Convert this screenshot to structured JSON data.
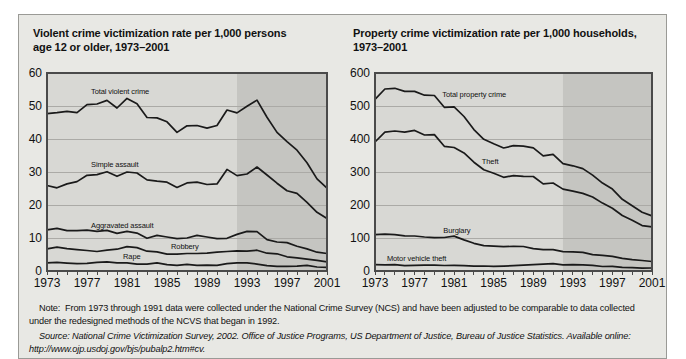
{
  "figure": {
    "note": "Note:  From 1973 through 1991 data were collected under the National Crime Survey (NCS) and have been adjusted to be comparable to data collected under the redesigned methods of the NCVS that began in 1992.",
    "source_italic": "Source: National Crime Victimization Survey, 2002.",
    "source_rest": " Office of Justice Programs, US Department of Justice, Bureau of Justice Statistics. Available online: http://www.ojp.usdoj.gov/bjs/pubalp2.htm#cv.",
    "colors": {
      "figure_bg": "#e8e8e4",
      "plot_bg": "#d8d8d4",
      "redesign_band_bg": "#c5c5c1",
      "grid": "#abaaa6",
      "axis": "#4a4a4a",
      "line": "#1a1a1a",
      "text": "#111111"
    }
  },
  "charts": [
    {
      "title_line1": "Violent crime victimization rate per 1,000 persons",
      "title_line2": "age 12 or older, 1973–2001"
    },
    {
      "title_line1": "Property crime victimization rate per 1,000 households,",
      "title_line2": "1973–2001"
    }
  ],
  "chart_data": [
    {
      "type": "line",
      "title": "Violent crime victimization rate per 1,000 persons age 12 or older, 1973–2001",
      "xlabel": "",
      "ylabel": "",
      "ylim": [
        0,
        60
      ],
      "yticks": [
        0,
        10,
        20,
        30,
        40,
        50,
        60
      ],
      "x": [
        1973,
        1974,
        1975,
        1976,
        1977,
        1978,
        1979,
        1980,
        1981,
        1982,
        1983,
        1984,
        1985,
        1986,
        1987,
        1988,
        1989,
        1990,
        1991,
        1992,
        1993,
        1994,
        1995,
        1996,
        1997,
        1998,
        1999,
        2000,
        2001
      ],
      "xtick_labels": [
        1973,
        1977,
        1981,
        1985,
        1989,
        1993,
        1997,
        2001
      ],
      "shaded_band": {
        "from": 1992,
        "to": 2001
      },
      "grid": true,
      "legend_position": "inline-labels",
      "series": [
        {
          "name": "Total violent crime",
          "values": [
            47.7,
            48.0,
            48.4,
            48.0,
            50.4,
            50.6,
            51.7,
            49.4,
            52.3,
            50.7,
            46.5,
            46.4,
            45.2,
            42.0,
            44.0,
            44.1,
            43.3,
            44.1,
            48.8,
            47.9,
            49.9,
            51.8,
            46.6,
            42.0,
            39.2,
            36.6,
            32.8,
            27.9,
            25.1
          ],
          "label": {
            "x": 1977.4,
            "y": 53.8
          }
        },
        {
          "name": "Simple assault",
          "values": [
            25.9,
            25.2,
            26.4,
            27.1,
            29.0,
            29.2,
            30.1,
            28.7,
            30.0,
            29.7,
            27.6,
            27.2,
            26.9,
            25.3,
            26.7,
            26.9,
            26.2,
            26.4,
            30.8,
            28.9,
            29.4,
            31.5,
            29.1,
            26.6,
            24.3,
            23.5,
            20.8,
            17.8,
            15.9
          ],
          "label": {
            "x": 1977.4,
            "y": 31.6
          }
        },
        {
          "name": "Aggravated assault",
          "values": [
            12.5,
            12.9,
            12.2,
            12.2,
            12.4,
            12.0,
            12.3,
            11.4,
            12.0,
            11.5,
            9.9,
            10.8,
            10.3,
            9.8,
            10.0,
            10.8,
            10.3,
            9.8,
            9.9,
            11.1,
            12.0,
            11.9,
            9.5,
            8.8,
            8.6,
            7.5,
            6.7,
            5.7,
            5.3
          ],
          "label": {
            "x": 1977.4,
            "y": 13.1
          }
        },
        {
          "name": "Robbery",
          "values": [
            6.7,
            7.2,
            6.8,
            6.5,
            6.2,
            5.9,
            6.3,
            6.6,
            7.4,
            7.1,
            6.0,
            5.8,
            5.1,
            5.1,
            5.3,
            5.3,
            5.4,
            5.7,
            5.9,
            6.1,
            6.0,
            6.3,
            5.4,
            5.2,
            4.3,
            4.0,
            3.6,
            3.2,
            2.8
          ],
          "label": {
            "x": 1985.4,
            "y": 6.6
          }
        },
        {
          "name": "Rape",
          "values": [
            2.5,
            2.6,
            2.4,
            2.2,
            2.3,
            2.6,
            2.8,
            2.5,
            2.5,
            2.1,
            2.1,
            2.5,
            1.9,
            1.7,
            2.0,
            1.7,
            1.8,
            1.7,
            2.2,
            2.5,
            2.5,
            2.1,
            1.6,
            1.4,
            1.4,
            1.5,
            1.7,
            1.2,
            1.1
          ],
          "label": {
            "x": 1980.6,
            "y": 3.5
          }
        }
      ]
    },
    {
      "type": "line",
      "title": "Property crime victimization rate per 1,000 households, 1973–2001",
      "xlabel": "",
      "ylabel": "",
      "ylim": [
        0,
        600
      ],
      "yticks": [
        0,
        100,
        200,
        300,
        400,
        500,
        600
      ],
      "x": [
        1973,
        1974,
        1975,
        1976,
        1977,
        1978,
        1979,
        1980,
        1981,
        1982,
        1983,
        1984,
        1985,
        1986,
        1987,
        1988,
        1989,
        1990,
        1991,
        1992,
        1993,
        1994,
        1995,
        1996,
        1997,
        1998,
        1999,
        2000,
        2001
      ],
      "xtick_labels": [
        1973,
        1977,
        1981,
        1985,
        1989,
        1993,
        1997,
        2001
      ],
      "shaded_band": {
        "from": 1992,
        "to": 2001
      },
      "grid": true,
      "legend_position": "inline-labels",
      "series": [
        {
          "name": "Total property crime",
          "values": [
            519.9,
            551.5,
            553.6,
            544.2,
            544.1,
            532.6,
            531.8,
            496.1,
            497.2,
            468.3,
            428.4,
            399.2,
            385.4,
            372.7,
            379.6,
            378.4,
            373.4,
            348.9,
            353.7,
            325.3,
            318.9,
            310.2,
            290.5,
            266.3,
            248.3,
            217.4,
            198.0,
            178.1,
            166.9
          ],
          "label": {
            "x": 1979.8,
            "y": 528
          }
        },
        {
          "name": "Theft",
          "values": [
            390.8,
            421.0,
            424.1,
            421.0,
            426.1,
            412.0,
            413.4,
            378.0,
            374.1,
            358.0,
            329.8,
            307.1,
            296.0,
            284.0,
            289.0,
            286.7,
            286.5,
            263.8,
            266.8,
            248.2,
            241.7,
            235.1,
            224.3,
            205.7,
            189.9,
            168.1,
            153.9,
            137.7,
            133.9
          ],
          "label": {
            "x": 1983.8,
            "y": 323
          }
        },
        {
          "name": "Burglary",
          "values": [
            110.0,
            111.8,
            110.0,
            106.7,
            106.2,
            103.1,
            100.9,
            101.4,
            105.9,
            94.1,
            84.0,
            76.9,
            75.2,
            73.8,
            74.6,
            74.3,
            67.7,
            64.5,
            64.6,
            58.6,
            58.2,
            56.3,
            49.3,
            47.2,
            44.6,
            38.5,
            34.1,
            31.8,
            28.7
          ],
          "label": {
            "x": 1979.9,
            "y": 116
          }
        },
        {
          "name": "Motor vehicle theft",
          "values": [
            19.1,
            18.8,
            19.5,
            16.5,
            17.0,
            17.5,
            17.5,
            16.7,
            17.1,
            16.2,
            14.6,
            15.2,
            14.2,
            15.0,
            16.0,
            17.5,
            19.2,
            20.6,
            22.2,
            18.5,
            19.0,
            18.8,
            16.9,
            13.5,
            13.8,
            10.8,
            10.0,
            8.6,
            9.0
          ],
          "label": {
            "x": 1974.2,
            "y": 30
          }
        }
      ]
    }
  ]
}
